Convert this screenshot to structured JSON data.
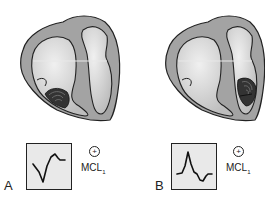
{
  "panels": [
    {
      "label": "A",
      "lead": {
        "symbol": "+",
        "name": "MCL",
        "subscript": "1"
      },
      "ecg_shape": "rS-like negative deflection followed by small upright wave",
      "activation_site": "left ventricle"
    },
    {
      "label": "B",
      "lead": {
        "symbol": "+",
        "name": "MCL",
        "subscript": "1"
      },
      "ecg_shape": "tall upright R followed by negative T-wave",
      "activation_site": "right ventricle"
    }
  ],
  "colors": {
    "heart_wall": "#9a9a9a",
    "chamber": "#d6d6d6",
    "outline": "#222222",
    "ecg_background": "#e9e9e9"
  }
}
